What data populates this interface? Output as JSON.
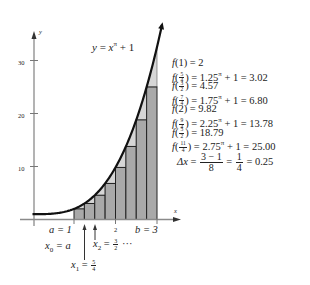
{
  "chart_data": {
    "type": "bar",
    "function": "x^pi + 1",
    "xlabel": "x",
    "ylabel": "y",
    "xlim": [
      0,
      3.1
    ],
    "ylim": [
      0,
      35
    ],
    "y_ticks": [
      10,
      20,
      30
    ],
    "x_tick_labels": [
      "a = 1",
      "2",
      "b = 3"
    ],
    "categories": [
      "1",
      "5/4",
      "3/2",
      "7/4",
      "2",
      "9/4",
      "5/2",
      "11/4"
    ],
    "values": [
      2,
      3.02,
      4.57,
      6.8,
      9.82,
      13.78,
      18.79,
      25.0
    ],
    "bar_left_edges": [
      1,
      1.25,
      1.5,
      1.75,
      2,
      2.25,
      2.5,
      2.75
    ],
    "bar_width": 0.25,
    "method": "left-endpoint Riemann sum",
    "grid": false,
    "annotations": [
      "x0 = a",
      "x1 = 5/4",
      "x2 = 3/2 ...",
      "Δx = (3 − 1)/8 = 1/4 = 0.25"
    ]
  },
  "graph": {
    "title_lhs": "y",
    "title_eq": "=",
    "title_base": "x",
    "title_exp": "π",
    "title_rhs": "+ 1",
    "y_axis_label": "y",
    "x_axis_label": "x",
    "y_ticks": [
      {
        "label": "30",
        "value": 30
      },
      {
        "label": "20",
        "value": 20
      },
      {
        "label": "10",
        "value": 10
      }
    ],
    "x_labels": {
      "a": "a = 1",
      "two": "2",
      "b": "b = 3"
    },
    "annotations": {
      "x0": "x",
      "x0_sub": "0",
      "x0_rest": "= a",
      "x1": "x",
      "x1_sub": "1",
      "x1_eq": "=",
      "x1_num": "5",
      "x1_den": "4",
      "x2": "x",
      "x2_sub": "2",
      "x2_eq": "=",
      "x2_num": "3",
      "x2_den": "2",
      "x2_rest": "···"
    },
    "colors": {
      "bar": "#a9a9a9",
      "wedge": "#d6d6d6",
      "curve": "#111111",
      "axis": "#888888"
    }
  },
  "equations": [
    {
      "fn": "f",
      "arg": "(1)",
      "rhs": "= 2"
    },
    {
      "fn": "f",
      "num": "5",
      "den": "4",
      "rhs": "= 1.25",
      "exp": "π",
      "rest": "+ 1 = 3.02"
    },
    {
      "fn": "f",
      "num": "3",
      "den": "2",
      "rhs": "= 4.57"
    },
    {
      "fn": "f",
      "num": "7",
      "den": "4",
      "rhs": "= 1.75",
      "exp": "π",
      "rest": "+ 1 = 6.80"
    },
    {
      "fn": "f",
      "arg": "(2)",
      "rhs": "= 9.82"
    },
    {
      "fn": "f",
      "num": "9",
      "den": "4",
      "rhs": "= 2.25",
      "exp": "π",
      "rest": "+ 1 = 13.78"
    },
    {
      "fn": "f",
      "num": "5",
      "den": "2",
      "rhs": "= 18.79"
    },
    {
      "fn": "f",
      "num": "11",
      "den": "4",
      "rhs": "= 2.75",
      "exp": "π",
      "rest": "+ 1 = 25.00"
    }
  ],
  "delta": {
    "lhs": "Δx",
    "eq1": "=",
    "num1": "3 − 1",
    "den1": "8",
    "eq2": "=",
    "num2": "1",
    "den2": "4",
    "result": "= 0.25"
  }
}
